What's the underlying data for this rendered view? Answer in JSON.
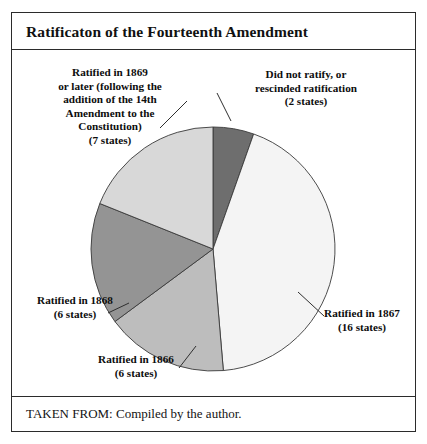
{
  "figure": {
    "title": "Ratificaton of the Fourteenth Amendment",
    "source": "TAKEN FROM: Compiled by the author."
  },
  "labels": {
    "not_ratified": "Did not ratify, or\nrescinded ratification\n(2 states)",
    "ratified_1867": "Ratified in 1867\n(16 states)",
    "ratified_1866": "Ratified in 1866\n(6 states)",
    "ratified_1868": "Ratified in 1868\n(6 states)",
    "ratified_1869": "Ratified in 1869\nor later (following the\naddition of the 14th\nAmendment to the\nConstitution)\n(7 states)"
  },
  "colors": {
    "slice_not_ratified": "#6e6e6e",
    "slice_1867": "#f4f4f4",
    "slice_1866": "#bdbdbd",
    "slice_1868": "#949494",
    "slice_1869": "#d8d8d8",
    "outline": "#3a3a3a",
    "border": "#2b2b2b",
    "text": "#0d0d0d"
  },
  "chart_data": {
    "type": "pie",
    "title": "Ratificaton of the Fourteenth Amendment",
    "unit": "states",
    "total": 37,
    "start_angle_deg": 0,
    "direction": "clockwise",
    "legend": "callout-labels",
    "categories": [
      "Did not ratify, or rescinded ratification",
      "Ratified in 1867",
      "Ratified in 1866",
      "Ratified in 1868",
      "Ratified in 1869 or later (following the addition of the 14th Amendment to the Constitution)"
    ],
    "values": [
      2,
      16,
      6,
      6,
      7
    ],
    "colors": [
      "#6e6e6e",
      "#f4f4f4",
      "#bdbdbd",
      "#949494",
      "#d8d8d8"
    ],
    "slices": [
      {
        "label": "Did not ratify, or rescinded ratification",
        "states": 2,
        "color": "#6e6e6e"
      },
      {
        "label": "Ratified in 1867",
        "states": 16,
        "color": "#f4f4f4"
      },
      {
        "label": "Ratified in 1866",
        "states": 6,
        "color": "#bdbdbd"
      },
      {
        "label": "Ratified in 1868",
        "states": 6,
        "color": "#949494"
      },
      {
        "label": "Ratified in 1869 or later",
        "states": 7,
        "color": "#d8d8d8"
      }
    ]
  }
}
